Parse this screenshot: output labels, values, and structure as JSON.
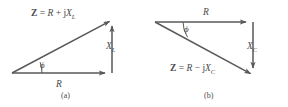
{
  "figure": {
    "background_color": "#ffffff",
    "stroke_color": "#595959",
    "text_color": "#4a4a4a"
  },
  "diagrams": [
    {
      "id": "a",
      "caption": "(a)",
      "type": "impedance-triangle-inductive",
      "hypotenuse_label": {
        "bold": "Z",
        "equals": " = ",
        "real": "R",
        "operator": " + ",
        "imag_unit": "j",
        "reactance": "X",
        "reactance_sub": "L",
        "full_text": "Z = R + jX_L"
      },
      "horizontal_label": "R",
      "vertical_label": {
        "symbol": "X",
        "subscript": "L"
      },
      "angle_label": "ϕ",
      "geometry": {
        "origin": [
          12,
          73
        ],
        "corner": [
          112,
          73
        ],
        "apex": [
          112,
          20
        ]
      }
    },
    {
      "id": "b",
      "caption": "(b)",
      "type": "impedance-triangle-capacitive",
      "hypotenuse_label": {
        "bold": "Z",
        "equals": " = ",
        "real": "R",
        "operator": " − ",
        "imag_unit": "j",
        "reactance": "X",
        "reactance_sub": "C",
        "full_text": "Z = R − jX_C"
      },
      "horizontal_label": "R",
      "vertical_label": {
        "symbol": "X",
        "subscript": "C"
      },
      "angle_label": "ϕ",
      "geometry": {
        "origin": [
          155,
          22
        ],
        "corner": [
          253,
          22
        ],
        "apex": [
          253,
          75
        ]
      }
    }
  ]
}
